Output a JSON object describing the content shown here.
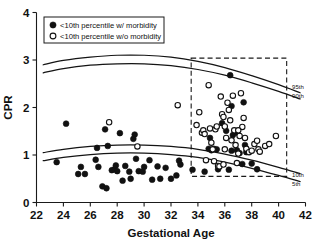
{
  "chart_data": {
    "type": "scatter",
    "title": "",
    "xlabel": "Gestational Age",
    "ylabel": "CPR",
    "xlim": [
      22,
      42
    ],
    "ylim": [
      0,
      4
    ],
    "xticks": [
      22,
      24,
      26,
      28,
      30,
      32,
      34,
      36,
      38,
      40,
      42
    ],
    "yticks": [
      0,
      1,
      2,
      3,
      4
    ],
    "grid": false,
    "legend_position": "top-left",
    "legend": [
      {
        "marker": "filled-circle",
        "label": "<10th percentile w/ morbidity"
      },
      {
        "marker": "open-circle",
        "label": "<10th percentile w/o morbidity"
      }
    ],
    "annotations": [
      {
        "text": "95th",
        "x": 41.0,
        "y": 2.44
      },
      {
        "text": "90th",
        "x": 41.0,
        "y": 2.24
      },
      {
        "text": "10th",
        "x": 41.0,
        "y": 0.58
      },
      {
        "text": "5th",
        "x": 41.0,
        "y": 0.4
      }
    ],
    "dashed_box": {
      "x0": 33.5,
      "x1": 40.6,
      "y0": 0.55,
      "y1": 3.04
    },
    "reference_curves": [
      {
        "name": "95th",
        "x": [
          22.5,
          24,
          26,
          28,
          30,
          32,
          34,
          36,
          38,
          40,
          41.6
        ],
        "y": [
          2.9,
          2.99,
          3.06,
          3.1,
          3.1,
          3.06,
          2.97,
          2.84,
          2.67,
          2.48,
          2.31
        ]
      },
      {
        "name": "90th",
        "x": [
          22.5,
          24,
          26,
          28,
          30,
          32,
          34,
          36,
          38,
          40,
          41.6
        ],
        "y": [
          2.73,
          2.82,
          2.89,
          2.92,
          2.92,
          2.88,
          2.8,
          2.68,
          2.52,
          2.34,
          2.18
        ]
      },
      {
        "name": "10th",
        "x": [
          22.5,
          24,
          26,
          28,
          30,
          32,
          34,
          36,
          38,
          40,
          41.6
        ],
        "y": [
          1.05,
          1.12,
          1.18,
          1.21,
          1.21,
          1.18,
          1.12,
          1.02,
          0.89,
          0.74,
          0.61
        ]
      },
      {
        "name": "5th",
        "x": [
          22.5,
          24,
          26,
          28,
          30,
          32,
          34,
          36,
          38,
          40,
          41.6
        ],
        "y": [
          0.88,
          0.95,
          1.01,
          1.04,
          1.04,
          1.01,
          0.95,
          0.85,
          0.72,
          0.57,
          0.44
        ]
      }
    ],
    "series": [
      {
        "name": "<10th percentile w/ morbidity",
        "marker": "filled-circle",
        "points": [
          [
            23.5,
            0.85
          ],
          [
            24.2,
            1.66
          ],
          [
            25.1,
            0.6
          ],
          [
            25.3,
            0.75
          ],
          [
            25.6,
            0.6
          ],
          [
            26.4,
            0.9
          ],
          [
            26.5,
            1.15
          ],
          [
            26.6,
            0.75
          ],
          [
            26.9,
            0.34
          ],
          [
            27.1,
            1.54
          ],
          [
            27.2,
            0.3
          ],
          [
            27.3,
            1.19
          ],
          [
            27.6,
            0.68
          ],
          [
            27.8,
            0.7
          ],
          [
            27.9,
            0.78
          ],
          [
            28.0,
            0.66
          ],
          [
            28.2,
            1.46
          ],
          [
            28.4,
            0.46
          ],
          [
            28.6,
            0.77
          ],
          [
            28.9,
            0.65
          ],
          [
            29.0,
            0.5
          ],
          [
            29.2,
            1.34
          ],
          [
            29.3,
            1.43
          ],
          [
            29.4,
            0.92
          ],
          [
            29.6,
            0.66
          ],
          [
            29.9,
            0.65
          ],
          [
            30.0,
            0.75
          ],
          [
            30.4,
            0.89
          ],
          [
            30.6,
            0.48
          ],
          [
            31.0,
            0.76
          ],
          [
            31.2,
            0.5
          ],
          [
            31.6,
            0.73
          ],
          [
            32.0,
            0.5
          ],
          [
            32.4,
            0.57
          ],
          [
            32.6,
            0.88
          ],
          [
            32.7,
            0.8
          ],
          [
            33.6,
            0.69
          ],
          [
            34.5,
            0.65
          ],
          [
            34.9,
            1.36
          ],
          [
            35.2,
            1.13
          ],
          [
            35.4,
            1.12
          ],
          [
            35.5,
            0.7
          ],
          [
            35.8,
            1.67
          ],
          [
            36.1,
            1.51
          ],
          [
            36.3,
            0.69
          ],
          [
            36.4,
            2.68
          ],
          [
            36.5,
            2.03
          ],
          [
            36.5,
            1.09
          ],
          [
            36.6,
            1.42
          ],
          [
            36.9,
            1.47
          ],
          [
            37.1,
            1.04
          ],
          [
            37.3,
            0.81
          ],
          [
            37.4,
            2.11
          ],
          [
            37.5,
            1.21
          ],
          [
            37.6,
            1.06
          ],
          [
            38.0,
            0.82
          ],
          [
            38.4,
            0.7
          ],
          [
            34.8,
            1.13
          ],
          [
            35.0,
            1.1
          ],
          [
            36.9,
            1.1
          ]
        ]
      },
      {
        "name": "<10th percentile w/o morbidity",
        "marker": "open-circle",
        "points": [
          [
            27.4,
            1.69
          ],
          [
            29.5,
            1.18
          ],
          [
            32.5,
            2.05
          ],
          [
            33.9,
            1.63
          ],
          [
            34.1,
            1.9
          ],
          [
            34.3,
            1.47
          ],
          [
            34.4,
            1.52
          ],
          [
            34.5,
            1.44
          ],
          [
            34.6,
            0.89
          ],
          [
            34.8,
            2.47
          ],
          [
            34.9,
            1.56
          ],
          [
            35.0,
            1.26
          ],
          [
            35.1,
            1.12
          ],
          [
            35.2,
            0.87
          ],
          [
            35.3,
            1.54
          ],
          [
            35.5,
            0.77
          ],
          [
            35.6,
            0.76
          ],
          [
            35.7,
            2.23
          ],
          [
            35.8,
            1.86
          ],
          [
            35.9,
            1.8
          ],
          [
            36.0,
            1.6
          ],
          [
            36.1,
            1.36
          ],
          [
            36.2,
            2.1
          ],
          [
            36.3,
            1.95
          ],
          [
            36.4,
            1.73
          ],
          [
            36.5,
            1.31
          ],
          [
            36.6,
            2.25
          ],
          [
            36.7,
            1.52
          ],
          [
            36.8,
            1.21
          ],
          [
            36.9,
            0.83
          ],
          [
            37.0,
            1.03
          ],
          [
            37.1,
            1.4
          ],
          [
            37.2,
            2.3
          ],
          [
            37.3,
            1.59
          ],
          [
            37.4,
            1.78
          ],
          [
            37.5,
            1.36
          ],
          [
            37.6,
            1.13
          ],
          [
            37.8,
            1.06
          ],
          [
            38.0,
            1.09
          ],
          [
            38.2,
            1.23
          ],
          [
            38.4,
            1.3
          ],
          [
            38.5,
            1.12
          ],
          [
            38.6,
            1.07
          ],
          [
            39.0,
            1.19
          ],
          [
            39.3,
            1.23
          ],
          [
            39.8,
            1.4
          ],
          [
            35.4,
            1.6
          ],
          [
            36.0,
            1.12
          ],
          [
            37.0,
            1.52
          ],
          [
            35.9,
            0.8
          ]
        ]
      }
    ]
  },
  "axes": {
    "x_title": "Gestational Age",
    "y_title": "CPR"
  }
}
